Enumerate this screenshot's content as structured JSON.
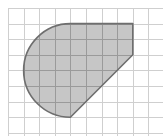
{
  "diagram": {
    "type": "geometry-figure-on-grid",
    "description": "Shaded figure on square grid: semicircle on the left, top edge, short right vertical edge, and a diagonal edge back to the bottom of the semicircle",
    "canvas": {
      "width": 163,
      "height": 136
    },
    "grid": {
      "origin_x": 8,
      "origin_y": 8,
      "cell_size": 15.6,
      "columns": 10,
      "rows": 8,
      "line_color": "#cfcfcf",
      "inside_line_color": "#9a9a9a"
    },
    "shape": {
      "fill_color": "#c6c6c6",
      "stroke_color": "#6e6e6e",
      "stroke_width": 1.6,
      "grid_vertices": [
        {
          "name": "top-left-arc-end",
          "col": 4,
          "row": 1
        },
        {
          "name": "top-right-corner",
          "col": 8,
          "row": 1
        },
        {
          "name": "right-lower-corner",
          "col": 8,
          "row": 3
        },
        {
          "name": "bottom-arc-end",
          "col": 4,
          "row": 7
        }
      ],
      "arc": {
        "center": {
          "col": 4,
          "row": 4
        },
        "radius_cells": 3,
        "side": "left",
        "kind": "semicircle"
      }
    }
  }
}
